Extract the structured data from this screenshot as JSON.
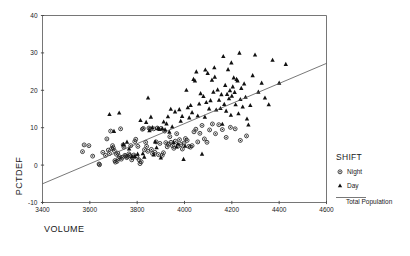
{
  "chart_data": {
    "type": "scatter",
    "title": "",
    "xlabel": "VOLUME",
    "ylabel": "PCTDEF",
    "xlim": [
      3400,
      4600
    ],
    "ylim": [
      -10,
      40
    ],
    "xticks": [
      3400,
      3600,
      3800,
      4000,
      4200,
      4400,
      4600
    ],
    "yticks": [
      -10,
      0,
      10,
      20,
      30,
      40
    ],
    "grid": false,
    "legend": {
      "title": "SHIFT",
      "position": "right",
      "entries": [
        {
          "label": "Night",
          "marker": "circle-dot",
          "color": "#222222"
        },
        {
          "label": "Day",
          "marker": "triangle",
          "color": "#111111"
        },
        {
          "label": "Total Population",
          "marker": "line",
          "color": "#555555"
        }
      ]
    },
    "fit_line": {
      "name": "Total Population",
      "x_start": 3400,
      "y_start": -5.0,
      "x_end": 4600,
      "y_end": 27.2,
      "slope": 0.0268,
      "intercept": -96.2
    },
    "series": [
      {
        "name": "Night",
        "marker": "circle-dot",
        "points": [
          [
            3569,
            3.6
          ],
          [
            3576,
            5.4
          ],
          [
            3596,
            5.2
          ],
          [
            3612,
            2.4
          ],
          [
            3639,
            0.3
          ],
          [
            3641,
            0.1
          ],
          [
            3655,
            3.4
          ],
          [
            3666,
            2.6
          ],
          [
            3672,
            7.0
          ],
          [
            3678,
            4.0
          ],
          [
            3683,
            3.1
          ],
          [
            3688,
            9.1
          ],
          [
            3692,
            4.4
          ],
          [
            3696,
            5.2
          ],
          [
            3699,
            4.6
          ],
          [
            3703,
            3.9
          ],
          [
            3706,
            1.2
          ],
          [
            3708,
            0.8
          ],
          [
            3712,
            2.9
          ],
          [
            3715,
            1.0
          ],
          [
            3718,
            3.2
          ],
          [
            3722,
            1.8
          ],
          [
            3726,
            2.2
          ],
          [
            3730,
            9.7
          ],
          [
            3733,
            1.6
          ],
          [
            3737,
            2.1
          ],
          [
            3741,
            5.4
          ],
          [
            3744,
            4.8
          ],
          [
            3748,
            2.6
          ],
          [
            3752,
            2.4
          ],
          [
            3756,
            2.0
          ],
          [
            3760,
            2.3
          ],
          [
            3765,
            3.0
          ],
          [
            3769,
            2.6
          ],
          [
            3773,
            5.2
          ],
          [
            3777,
            1.4
          ],
          [
            3781,
            2.0
          ],
          [
            3786,
            2.7
          ],
          [
            3790,
            6.3
          ],
          [
            3794,
            6.9
          ],
          [
            3799,
            2.1
          ],
          [
            3803,
            5.0
          ],
          [
            3808,
            1.4
          ],
          [
            3812,
            0.4
          ],
          [
            3817,
            0.9
          ],
          [
            3822,
            9.6
          ],
          [
            3826,
            9.8
          ],
          [
            3831,
            4.1
          ],
          [
            3836,
            6.1
          ],
          [
            3840,
            5.0
          ],
          [
            3845,
            3.7
          ],
          [
            3850,
            9.9
          ],
          [
            3855,
            9.6
          ],
          [
            3860,
            4.2
          ],
          [
            3865,
            3.1
          ],
          [
            3870,
            9.7
          ],
          [
            3875,
            3.4
          ],
          [
            3880,
            6.2
          ],
          [
            3885,
            9.9
          ],
          [
            3890,
            2.8
          ],
          [
            3896,
            5.8
          ],
          [
            3901,
            9.8
          ],
          [
            3906,
            2.6
          ],
          [
            3911,
            3.3
          ],
          [
            3916,
            9.1
          ],
          [
            3921,
            6.0
          ],
          [
            3927,
            4.9
          ],
          [
            3932,
            5.6
          ],
          [
            3938,
            7.6
          ],
          [
            3943,
            6.1
          ],
          [
            3949,
            5.2
          ],
          [
            3955,
            4.5
          ],
          [
            3961,
            6.4
          ],
          [
            3967,
            8.4
          ],
          [
            3973,
            5.1
          ],
          [
            3979,
            6.8
          ],
          [
            3985,
            5.5
          ],
          [
            3991,
            4.3
          ],
          [
            3998,
            5.9
          ],
          [
            4004,
            7.1
          ],
          [
            4011,
            6.6
          ],
          [
            4018,
            5.0
          ],
          [
            4025,
            4.8
          ],
          [
            4032,
            5.2
          ],
          [
            4040,
            8.9
          ],
          [
            4048,
            9.6
          ],
          [
            4056,
            6.2
          ],
          [
            4065,
            8.5
          ],
          [
            4074,
            10.6
          ],
          [
            4084,
            7.0
          ],
          [
            4095,
            6.1
          ],
          [
            4106,
            9.4
          ],
          [
            4118,
            11.0
          ],
          [
            4131,
            8.4
          ],
          [
            4145,
            10.8
          ],
          [
            4160,
            9.5
          ],
          [
            4176,
            7.4
          ],
          [
            4194,
            10.1
          ],
          [
            4214,
            9.7
          ],
          [
            4236,
            6.6
          ],
          [
            4262,
            7.8
          ]
        ]
      },
      {
        "name": "Day",
        "marker": "triangle",
        "points": [
          [
            3683,
            13.6
          ],
          [
            3702,
            9.1
          ],
          [
            3724,
            14.0
          ],
          [
            3742,
            5.6
          ],
          [
            3757,
            6.2
          ],
          [
            3766,
            4.4
          ],
          [
            3778,
            2.3
          ],
          [
            3790,
            2.4
          ],
          [
            3802,
            3.0
          ],
          [
            3814,
            12.0
          ],
          [
            3824,
            3.1
          ],
          [
            3830,
            2.2
          ],
          [
            3838,
            11.5
          ],
          [
            3846,
            18.0
          ],
          [
            3852,
            9.3
          ],
          [
            3858,
            12.9
          ],
          [
            3864,
            10.1
          ],
          [
            3870,
            2.8
          ],
          [
            3876,
            6.3
          ],
          [
            3882,
            4.7
          ],
          [
            3888,
            9.9
          ],
          [
            3894,
            9.6
          ],
          [
            3900,
            2.0
          ],
          [
            3906,
            9.8
          ],
          [
            3912,
            11.6
          ],
          [
            3918,
            9.5
          ],
          [
            3924,
            11.1
          ],
          [
            3930,
            13.0
          ],
          [
            3936,
            8.9
          ],
          [
            3942,
            15.0
          ],
          [
            3948,
            10.3
          ],
          [
            3954,
            6.1
          ],
          [
            3960,
            14.3
          ],
          [
            3966,
            4.9
          ],
          [
            3972,
            5.7
          ],
          [
            3978,
            14.9
          ],
          [
            3984,
            11.8
          ],
          [
            3990,
            13.1
          ],
          [
            3996,
            1.6
          ],
          [
            4002,
            5.1
          ],
          [
            4008,
            20.1
          ],
          [
            4014,
            15.4
          ],
          [
            4020,
            12.7
          ],
          [
            4026,
            16.0
          ],
          [
            4032,
            14.1
          ],
          [
            4038,
            23.0
          ],
          [
            4044,
            22.6
          ],
          [
            4050,
            25.0
          ],
          [
            4056,
            13.2
          ],
          [
            4062,
            16.4
          ],
          [
            4068,
            19.2
          ],
          [
            4074,
            3.0
          ],
          [
            4080,
            18.4
          ],
          [
            4086,
            12.9
          ],
          [
            4092,
            16.8
          ],
          [
            4098,
            24.6
          ],
          [
            4104,
            15.1
          ],
          [
            4110,
            17.3
          ],
          [
            4116,
            22.8
          ],
          [
            4122,
            19.6
          ],
          [
            4128,
            23.6
          ],
          [
            4134,
            14.8
          ],
          [
            4140,
            20.2
          ],
          [
            4146,
            17.4
          ],
          [
            4152,
            15.2
          ],
          [
            4156,
            18.9
          ],
          [
            4160,
            11.0
          ],
          [
            4164,
            29.1
          ],
          [
            4168,
            16.3
          ],
          [
            4172,
            21.4
          ],
          [
            4176,
            14.5
          ],
          [
            4180,
            19.0
          ],
          [
            4184,
            25.6
          ],
          [
            4188,
            17.8
          ],
          [
            4192,
            20.0
          ],
          [
            4196,
            13.4
          ],
          [
            4200,
            18.5
          ],
          [
            4204,
            21.0
          ],
          [
            4208,
            23.4
          ],
          [
            4212,
            19.5
          ],
          [
            4216,
            16.2
          ],
          [
            4220,
            23.0
          ],
          [
            4224,
            22.6
          ],
          [
            4228,
            13.8
          ],
          [
            4232,
            30.0
          ],
          [
            4236,
            17.6
          ],
          [
            4240,
            20.6
          ],
          [
            4246,
            15.6
          ],
          [
            4252,
            21.8
          ],
          [
            4258,
            18.2
          ],
          [
            4264,
            12.4
          ],
          [
            4270,
            10.8
          ],
          [
            4278,
            16.0
          ],
          [
            4288,
            24.0
          ],
          [
            4298,
            29.5
          ],
          [
            4312,
            19.6
          ],
          [
            4326,
            22.0
          ],
          [
            4340,
            18.0
          ],
          [
            4356,
            16.2
          ],
          [
            4372,
            28.1
          ],
          [
            4400,
            22.0
          ],
          [
            4428,
            27.0
          ],
          [
            4088,
            25.5
          ],
          [
            4126,
            26.1
          ],
          [
            4198,
            27.4
          ]
        ]
      }
    ]
  }
}
